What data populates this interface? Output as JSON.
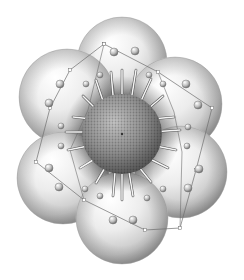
{
  "figure": {
    "width": 244,
    "height": 280,
    "background": "#ffffff",
    "center": {
      "x": 122,
      "y": 134,
      "r": 40
    },
    "core_colors": {
      "light": "#bdbdbd",
      "mid": "#8a8a8a",
      "dark": "#4a4a4a"
    },
    "lobes": [
      {
        "x": 122,
        "y": 62,
        "r": 45
      },
      {
        "x": 67,
        "y": 97,
        "r": 48
      },
      {
        "x": 175,
        "y": 104,
        "r": 47
      },
      {
        "x": 63,
        "y": 178,
        "r": 46
      },
      {
        "x": 181,
        "y": 172,
        "r": 46
      },
      {
        "x": 122,
        "y": 218,
        "r": 46
      }
    ],
    "spokes": [
      [
        122,
        94,
        122,
        70
      ],
      [
        113,
        95,
        111,
        72
      ],
      [
        132,
        95,
        136,
        70
      ],
      [
        103,
        101,
        96,
        80
      ],
      [
        141,
        101,
        151,
        79
      ],
      [
        96,
        109,
        83,
        96
      ],
      [
        148,
        109,
        163,
        96
      ],
      [
        92,
        119,
        73,
        117
      ],
      [
        152,
        119,
        174,
        117
      ],
      [
        92,
        132,
        66,
        132
      ],
      [
        152,
        132,
        180,
        130
      ],
      [
        93,
        145,
        68,
        150
      ],
      [
        151,
        145,
        176,
        150
      ],
      [
        98,
        157,
        80,
        168
      ],
      [
        146,
        157,
        168,
        168
      ],
      [
        106,
        166,
        96,
        183
      ],
      [
        138,
        166,
        151,
        182
      ],
      [
        115,
        172,
        113,
        196
      ],
      [
        129,
        172,
        133,
        196
      ],
      [
        122,
        174,
        122,
        200
      ]
    ],
    "nodes": [
      {
        "x": 114,
        "y": 52,
        "r": 4
      },
      {
        "x": 135,
        "y": 51,
        "r": 4
      },
      {
        "x": 60,
        "y": 84,
        "r": 4
      },
      {
        "x": 49,
        "y": 103,
        "r": 4
      },
      {
        "x": 100,
        "y": 75,
        "r": 3
      },
      {
        "x": 86,
        "y": 84,
        "r": 3
      },
      {
        "x": 186,
        "y": 84,
        "r": 4
      },
      {
        "x": 198,
        "y": 105,
        "r": 4
      },
      {
        "x": 149,
        "y": 75,
        "r": 3
      },
      {
        "x": 163,
        "y": 84,
        "r": 3
      },
      {
        "x": 61,
        "y": 126,
        "r": 3
      },
      {
        "x": 61,
        "y": 146,
        "r": 3
      },
      {
        "x": 188,
        "y": 127,
        "r": 3
      },
      {
        "x": 187,
        "y": 146,
        "r": 3
      },
      {
        "x": 49,
        "y": 168,
        "r": 4
      },
      {
        "x": 59,
        "y": 187,
        "r": 4
      },
      {
        "x": 199,
        "y": 169,
        "r": 4
      },
      {
        "x": 188,
        "y": 188,
        "r": 4
      },
      {
        "x": 85,
        "y": 189,
        "r": 3
      },
      {
        "x": 163,
        "y": 189,
        "r": 3
      },
      {
        "x": 113,
        "y": 220,
        "r": 4
      },
      {
        "x": 133,
        "y": 220,
        "r": 4
      },
      {
        "x": 100,
        "y": 196,
        "r": 3
      },
      {
        "x": 147,
        "y": 198,
        "r": 3
      }
    ],
    "frame": [
      [
        104,
        44
      ],
      [
        158,
        72
      ],
      [
        212,
        108
      ],
      [
        196,
        170
      ],
      [
        180,
        228
      ],
      [
        145,
        230
      ],
      [
        84,
        200
      ],
      [
        36,
        162
      ],
      [
        50,
        108
      ],
      [
        70,
        70
      ],
      [
        104,
        44
      ]
    ],
    "frame_inner": [
      [
        104,
        44
      ],
      [
        88,
        110
      ],
      [
        70,
        150
      ],
      [
        84,
        200
      ]
    ],
    "frame_inner2": [
      [
        158,
        72
      ],
      [
        174,
        112
      ],
      [
        182,
        152
      ],
      [
        180,
        228
      ]
    ],
    "line_color": "#6f6f6f",
    "spoke_color": "#f4f4f4"
  }
}
